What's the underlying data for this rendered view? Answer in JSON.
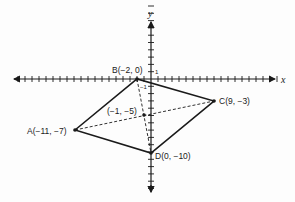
{
  "figure": {
    "type": "coordinate-plane-quadrilateral",
    "axes": {
      "x_label": "x",
      "y_label": "y",
      "tick_label_pos": "1",
      "tick_label_neg": "−1",
      "x_range": [
        -19,
        18
      ],
      "y_range": [
        -15,
        10
      ]
    },
    "points": {
      "A": {
        "label": "A(−11, −7)",
        "x": -11,
        "y": -7
      },
      "B": {
        "label": "B(−2, 0)",
        "x": -2,
        "y": 0
      },
      "C": {
        "label": "C(9, −3)",
        "x": 9,
        "y": -3
      },
      "D": {
        "label": "D(0, −10)",
        "x": 0,
        "y": -10
      },
      "M": {
        "label": "(−1, −5)",
        "x": -1,
        "y": -5
      }
    },
    "sides": [
      "AB",
      "BC",
      "CD",
      "DA"
    ],
    "diagonals_dashed": [
      "AC",
      "BD"
    ],
    "colors": {
      "stroke": "#1a1a1a",
      "background": "#fdfdfd"
    }
  }
}
